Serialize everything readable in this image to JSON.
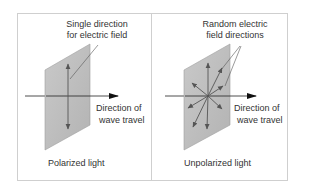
{
  "figure": {
    "panels": [
      {
        "id": "polarized",
        "caption": "Polarized light",
        "callout_line1": "Single direction",
        "callout_line2": "for electric field",
        "travel_line1": "Direction of",
        "travel_line2": "wave travel"
      },
      {
        "id": "unpolarized",
        "caption": "Unpolarized light",
        "callout_line1": "Random electric",
        "callout_line2": "field directions",
        "travel_line1": "Direction of",
        "travel_line2": "wave travel"
      }
    ],
    "colors": {
      "frame_border": "#cfcfcf",
      "plate_fill": "#bdbdbd",
      "plate_edge": "#a0a0a0",
      "arrow": "#555555",
      "axis": "#222222",
      "text": "#333333"
    }
  }
}
